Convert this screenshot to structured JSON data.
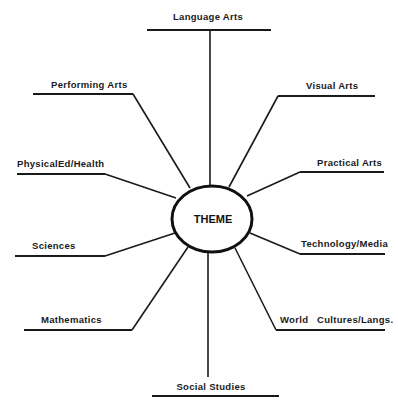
{
  "diagram": {
    "type": "theme-web",
    "center": {
      "label": "THEME"
    },
    "spokes": [
      {
        "id": "language-arts",
        "label": "Language Arts",
        "position": "top"
      },
      {
        "id": "visual-arts",
        "label": "Visual Arts",
        "position": "upper-right"
      },
      {
        "id": "practical-arts",
        "label": "Practical Arts",
        "position": "right-upper"
      },
      {
        "id": "technology-media",
        "label": "Technology/Media",
        "position": "right-lower"
      },
      {
        "id": "world-cultures",
        "label": "World   Cultures/Langs.",
        "position": "lower-right"
      },
      {
        "id": "social-studies",
        "label": "Social Studies",
        "position": "bottom"
      },
      {
        "id": "mathematics",
        "label": "Mathematics",
        "position": "lower-left"
      },
      {
        "id": "sciences",
        "label": "Sciences",
        "position": "left-lower"
      },
      {
        "id": "physical-ed-health",
        "label": "PhysicalEd/Health",
        "position": "left-upper"
      },
      {
        "id": "performing-arts",
        "label": "Performing Arts",
        "position": "upper-left"
      }
    ]
  }
}
